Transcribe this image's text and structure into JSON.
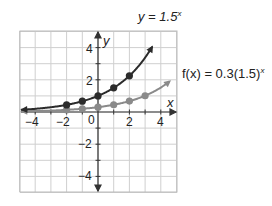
{
  "chart_data": {
    "type": "line",
    "title": "",
    "xlabel": "x",
    "ylabel": "y",
    "xlim": [
      -5,
      5
    ],
    "ylim": [
      -5,
      5
    ],
    "grid": true,
    "x_ticks": [
      -4,
      -2,
      0,
      2,
      4
    ],
    "y_ticks": [
      4,
      2,
      -2,
      -4
    ],
    "series": [
      {
        "name": "y = 1.5^x",
        "color": "#2b2b2b",
        "points": [
          [
            -2,
            0.44
          ],
          [
            -1,
            0.67
          ],
          [
            0,
            1
          ],
          [
            1,
            1.5
          ],
          [
            2,
            2.25
          ]
        ],
        "label_base": "y = 1.5",
        "label_exp": "x"
      },
      {
        "name": "f(x) = 0.3(1.5)^x",
        "color": "#8a8a8a",
        "points": [
          [
            -2,
            0.13
          ],
          [
            -1,
            0.2
          ],
          [
            0,
            0.3
          ],
          [
            1,
            0.45
          ],
          [
            2,
            0.68
          ],
          [
            3,
            1.01
          ]
        ],
        "label_base": "f(x) = 0.3(1.5)",
        "label_exp": "x"
      }
    ]
  },
  "labels": {
    "x_axis": "x",
    "y_axis": "y",
    "tick_x_neg4": "−4",
    "tick_x_neg2": "−2",
    "tick_x_0": "0",
    "tick_x_2": "2",
    "tick_x_4": "4",
    "tick_y_4": "4",
    "tick_y_2": "2",
    "tick_y_neg2": "−2",
    "tick_y_neg4": "−4",
    "curve1_base": "y = 1.5",
    "curve1_exp": "x",
    "curve2_base": "f(x) = 0.3(1.5)",
    "curve2_exp": "x"
  }
}
